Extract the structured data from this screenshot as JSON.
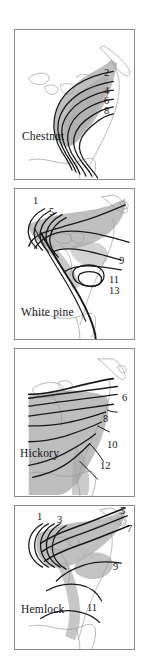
{
  "figure": {
    "width": 149,
    "height": 661,
    "background": "#ffffff",
    "panel_border_color": "#8a8a8a",
    "range_fill_color": "#b4b4b4",
    "coastline_color": "#9a9a9a",
    "isochrone_line_color": "#1a1a1a"
  },
  "panels": [
    {
      "id": "chestnut",
      "species_label": "Chestnut",
      "x": 14,
      "y": 29,
      "width": 121,
      "height": 151,
      "isochrone_labels": [
        {
          "text": "2",
          "x": 103,
          "y": 72
        },
        {
          "text": "4",
          "x": 103,
          "y": 90
        },
        {
          "text": "6",
          "x": 103,
          "y": 100
        },
        {
          "text": "8",
          "x": 103,
          "y": 110
        }
      ],
      "species_label_pos": {
        "x": 21,
        "y": 137
      }
    },
    {
      "id": "white-pine",
      "species_label": "White pine",
      "x": 14,
      "y": 188,
      "width": 121,
      "height": 152,
      "isochrone_labels": [
        {
          "text": "1",
          "x": 32,
          "y": 200
        },
        {
          "text": "5",
          "x": 48,
          "y": 211
        },
        {
          "text": "9",
          "x": 118,
          "y": 260
        },
        {
          "text": "11",
          "x": 108,
          "y": 279
        },
        {
          "text": "13",
          "x": 108,
          "y": 290
        }
      ],
      "species_label_pos": {
        "x": 20,
        "y": 315
      }
    },
    {
      "id": "hickory",
      "species_label": "Hickory",
      "x": 14,
      "y": 348,
      "width": 121,
      "height": 149,
      "isochrone_labels": [
        {
          "text": "6",
          "x": 122,
          "y": 398
        },
        {
          "text": "8",
          "x": 102,
          "y": 419
        },
        {
          "text": "10",
          "x": 110,
          "y": 445
        },
        {
          "text": "12",
          "x": 103,
          "y": 466
        }
      ],
      "species_label_pos": {
        "x": 19,
        "y": 455
      }
    },
    {
      "id": "hemlock",
      "species_label": "Hemlock",
      "x": 14,
      "y": 505,
      "width": 121,
      "height": 145,
      "isochrone_labels": [
        {
          "text": "1",
          "x": 36,
          "y": 516
        },
        {
          "text": "3",
          "x": 56,
          "y": 519
        },
        {
          "text": "5",
          "x": 119,
          "y": 504
        },
        {
          "text": "7",
          "x": 127,
          "y": 528
        },
        {
          "text": "9",
          "x": 112,
          "y": 566
        },
        {
          "text": "11",
          "x": 88,
          "y": 607
        }
      ],
      "species_label_pos": {
        "x": 20,
        "y": 610
      }
    }
  ]
}
